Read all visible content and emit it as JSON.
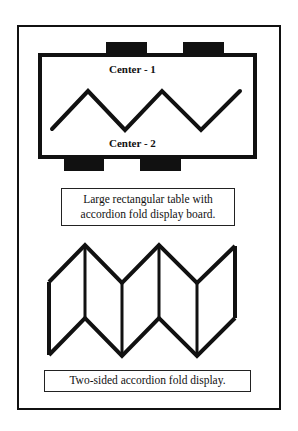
{
  "diagram": {
    "top": {
      "table_shape": "large rectangular table",
      "center_top_label": "Center - 1",
      "center_bottom_label": "Center - 2",
      "caption_line1": "Large rectangular table with",
      "caption_line2": "accordion fold display board."
    },
    "bottom": {
      "caption": "Two-sided accordion fold display."
    },
    "colors": {
      "stroke": "#111111",
      "background": "#ffffff"
    }
  }
}
